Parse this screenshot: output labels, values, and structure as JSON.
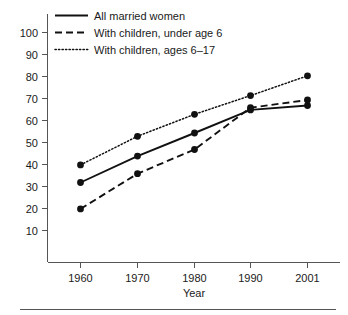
{
  "chart_data": {
    "type": "line",
    "title": "",
    "xlabel": "Year",
    "ylabel": "",
    "categories": [
      "1960",
      "1970",
      "1980",
      "1990",
      "2001"
    ],
    "x": [
      1960,
      1970,
      1980,
      1990,
      2001
    ],
    "xtick_labels": [
      "1960",
      "1970",
      "1980",
      "1990",
      "2001"
    ],
    "ytick_labels": [
      "10",
      "20",
      "30",
      "40",
      "50",
      "60",
      "70",
      "80",
      "90",
      "100"
    ],
    "yticks": [
      10,
      20,
      30,
      40,
      50,
      60,
      70,
      80,
      90,
      100
    ],
    "ylim": [
      0,
      107
    ],
    "grid": false,
    "legend_position": "top-left-inside",
    "series": [
      {
        "name": "All married women",
        "style": "solid",
        "values": [
          32,
          44,
          54.5,
          65,
          67
        ]
      },
      {
        "name": "With children, under age 6",
        "style": "dashed",
        "values": [
          20,
          36,
          47,
          66,
          69.5
        ]
      },
      {
        "name": "With children, ages 6–17",
        "style": "dotted",
        "values": [
          40,
          53,
          63,
          71.5,
          80.5
        ]
      }
    ]
  },
  "legend": {
    "items": [
      {
        "label": "All married women"
      },
      {
        "label": "With children, under age 6"
      },
      {
        "label": "With children, ages 6–17"
      }
    ]
  },
  "axes": {
    "x_title": "Year"
  },
  "colors": {
    "ink": "#111111",
    "axis": "#555555",
    "background": "#ffffff"
  }
}
